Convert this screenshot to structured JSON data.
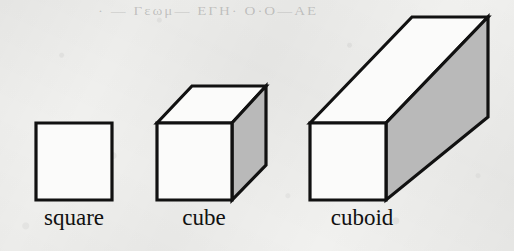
{
  "figure": {
    "background_color": "#f1f1ef",
    "stroke_color": "#111111",
    "face_front_color": "#fbfbfa",
    "face_shaded_color": "#b9b9b9",
    "bleed_text": "·  — Γεωμ— ΕΓΗ· Ο·Ο—ΑΕ",
    "shapes": [
      {
        "id": "square",
        "label": "square",
        "kind": "2d-polygon",
        "faces": 1,
        "front_face": [
          [
            36,
            123
          ],
          [
            112,
            123
          ],
          [
            112,
            200
          ],
          [
            36,
            200
          ]
        ]
      },
      {
        "id": "cube",
        "label": "cube",
        "kind": "3d-solid",
        "faces": 3,
        "front_face": [
          [
            157,
            123
          ],
          [
            232,
            123
          ],
          [
            232,
            200
          ],
          [
            157,
            200
          ]
        ],
        "top_face": [
          [
            157,
            123
          ],
          [
            192,
            86
          ],
          [
            266,
            86
          ],
          [
            232,
            123
          ]
        ],
        "side_face": [
          [
            232,
            123
          ],
          [
            266,
            86
          ],
          [
            266,
            165
          ],
          [
            232,
            200
          ]
        ]
      },
      {
        "id": "cuboid",
        "label": "cuboid",
        "kind": "3d-solid",
        "faces": 3,
        "front_face": [
          [
            310,
            123
          ],
          [
            386,
            123
          ],
          [
            386,
            200
          ],
          [
            310,
            200
          ]
        ],
        "top_face": [
          [
            310,
            123
          ],
          [
            412,
            17
          ],
          [
            488,
            17
          ],
          [
            386,
            123
          ]
        ],
        "side_face": [
          [
            386,
            123
          ],
          [
            488,
            17
          ],
          [
            488,
            117
          ],
          [
            386,
            200
          ]
        ]
      }
    ],
    "labels": [
      {
        "id": "label-square",
        "text": "square"
      },
      {
        "id": "label-cube",
        "text": "cube"
      },
      {
        "id": "label-cuboid",
        "text": "cuboid"
      }
    ]
  }
}
